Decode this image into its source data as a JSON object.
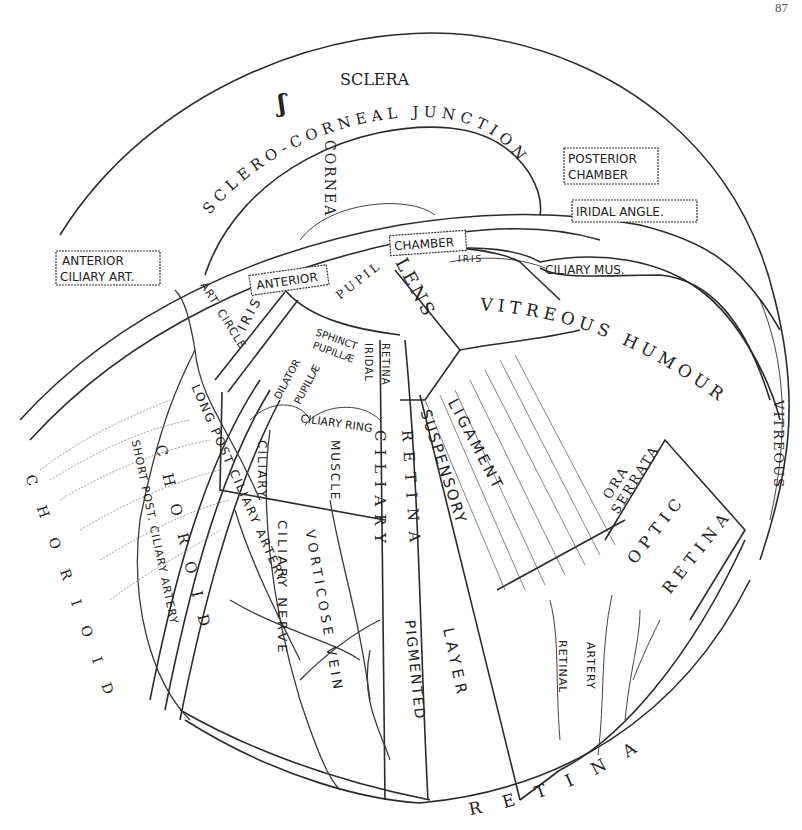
{
  "page": {
    "header": "",
    "page_number": "87"
  },
  "figure": {
    "type": "anatomical-diagram",
    "labels": {
      "sclera_top": "SCLERA",
      "sclera_left": "SCLERA",
      "sclero_corneal_junction": "SCLERO-CORNEAL JUNCTION",
      "cornea": "CORNEA",
      "posterior_chamber": "POSTERIOR CHAMBER",
      "iridal_angle": "IRIDAL ANGLE.",
      "anterior_ciliary_art": "ANTERIOR CILIARY ART.",
      "anterior": "ANTERIOR",
      "pupil": "PUPIL",
      "chamber": "CHAMBER",
      "iris_small": "IRIS",
      "ciliary_mus": "CILIARY MUS.",
      "lens": "LENS",
      "art_circle": "ART. CIRCLE",
      "iris": "IRIS",
      "sphinct_pupillae": "SPHINCT PUPILLÆ",
      "dilator_pupillae": "DILATOR PUPILLÆ",
      "iridal_retina": "IRIDAL RETINA",
      "ciliary_ring": "CILIARY RING",
      "ciliary_zone": "CILIARY",
      "muscle": "MUSCLE",
      "vitreous_humour": "VITREOUS HUMOUR",
      "vitreous_right": "VITREOUS",
      "suspensory": "SUSPENSORY",
      "ligament": "LIGAMENT",
      "ciliary_retina_1": "CILIARY",
      "ciliary_retina_2": "RETINA",
      "ora": "ORA",
      "serrata": "SERRATA",
      "optic": "OPTIC",
      "retina_optic": "RETINA",
      "choroid_outer": "CHORIOID",
      "choroid_inner": "CHOROID",
      "short_post_ciliary_artery": "SHORT POST. CILIARY ARTERY",
      "long_post_ciliary_artery": "LONG POST CILIARY ARTERY",
      "ciliary_nerve": "CILIARY NERVE",
      "vortic_ose_vein": "VORTICOSE VEIN",
      "pigmented": "PIGMENTED",
      "layer": "LAYER",
      "retinal": "RETINAL",
      "artery": "ARTERY",
      "retina_bottom": "RETINA"
    }
  }
}
